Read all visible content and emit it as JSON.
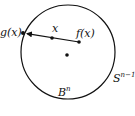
{
  "diagram": {
    "colors": {
      "stroke": "#111111",
      "background": "#ffffff"
    },
    "circle": {
      "cx": 68,
      "cy": 52,
      "r": 47
    },
    "points": {
      "g": {
        "x": 23,
        "y": 33
      },
      "x": {
        "x": 52,
        "y": 38
      },
      "f": {
        "x": 79,
        "y": 42
      },
      "center": {
        "x": 67,
        "y": 55
      }
    },
    "labels": {
      "g": "g(x)",
      "x": "x",
      "f": "f(x)",
      "sphere_base": "S",
      "sphere_exp": "n−1",
      "ball_base": "B",
      "ball_exp": "n"
    }
  }
}
